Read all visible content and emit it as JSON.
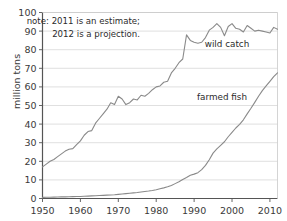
{
  "chart_data": {
    "type": "line",
    "title": "",
    "xlabel": "",
    "ylabel": "million tons",
    "xlim": [
      1950,
      2012
    ],
    "ylim": [
      0,
      100
    ],
    "grid": true,
    "legend_position": "inline-annotation",
    "xticks": [
      "1950",
      "1960",
      "1970",
      "1980",
      "1990",
      "2000",
      "2010"
    ],
    "xtick_values": [
      1950,
      1960,
      1970,
      1980,
      1990,
      2000,
      2010
    ],
    "yticks": [
      "0",
      "10",
      "20",
      "30",
      "40",
      "50",
      "60",
      "70",
      "80",
      "90",
      "100"
    ],
    "ytick_values": [
      0,
      10,
      20,
      30,
      40,
      50,
      60,
      70,
      80,
      90,
      100
    ],
    "annotations": [
      {
        "name": "note-line-1",
        "text": "note: 2011 is an estimate;"
      },
      {
        "name": "note-line-2",
        "text": "2012 is a projection."
      }
    ],
    "series": [
      {
        "name": "wild catch",
        "label": "wild catch",
        "color": "#8a8a8a",
        "x": [
          1950,
          1951,
          1952,
          1953,
          1954,
          1955,
          1956,
          1957,
          1958,
          1959,
          1960,
          1961,
          1962,
          1963,
          1964,
          1965,
          1966,
          1967,
          1968,
          1969,
          1970,
          1971,
          1972,
          1973,
          1974,
          1975,
          1976,
          1977,
          1978,
          1979,
          1980,
          1981,
          1982,
          1983,
          1984,
          1985,
          1986,
          1987,
          1988,
          1989,
          1990,
          1991,
          1992,
          1993,
          1994,
          1995,
          1996,
          1997,
          1998,
          1999,
          2000,
          2001,
          2002,
          2003,
          2004,
          2005,
          2006,
          2007,
          2008,
          2009,
          2010,
          2011,
          2012
        ],
        "values": [
          17.0,
          18.5,
          20.0,
          21.0,
          22.5,
          24.0,
          25.5,
          26.5,
          26.8,
          29.0,
          31.0,
          34.0,
          36.0,
          36.5,
          40.5,
          43.0,
          45.5,
          48.0,
          51.5,
          50.5,
          55.0,
          53.5,
          50.5,
          51.5,
          53.5,
          53.0,
          55.5,
          55.0,
          56.5,
          58.5,
          60.0,
          60.5,
          62.5,
          63.0,
          67.5,
          70.0,
          73.0,
          75.0,
          88.0,
          85.0,
          84.0,
          83.5,
          84.0,
          86.5,
          90.5,
          92.0,
          94.0,
          92.0,
          87.5,
          92.5,
          94.0,
          91.5,
          91.0,
          89.5,
          93.0,
          91.5,
          90.0,
          90.5,
          90.0,
          89.5,
          89.0,
          92.0,
          91.0
        ]
      },
      {
        "name": "farmed fish",
        "label": "farmed fish",
        "color": "#8a8a8a",
        "x": [
          1950,
          1951,
          1952,
          1953,
          1954,
          1955,
          1956,
          1957,
          1958,
          1959,
          1960,
          1961,
          1962,
          1963,
          1964,
          1965,
          1966,
          1967,
          1968,
          1969,
          1970,
          1971,
          1972,
          1973,
          1974,
          1975,
          1976,
          1977,
          1978,
          1979,
          1980,
          1981,
          1982,
          1983,
          1984,
          1985,
          1986,
          1987,
          1988,
          1989,
          1990,
          1991,
          1992,
          1993,
          1994,
          1995,
          1996,
          1997,
          1998,
          1999,
          2000,
          2001,
          2002,
          2003,
          2004,
          2005,
          2006,
          2007,
          2008,
          2009,
          2010,
          2011,
          2012
        ],
        "values": [
          0.6,
          0.65,
          0.7,
          0.75,
          0.8,
          0.85,
          0.9,
          0.95,
          1.0,
          1.05,
          1.1,
          1.2,
          1.3,
          1.4,
          1.5,
          1.6,
          1.7,
          1.8,
          1.9,
          2.0,
          2.2,
          2.4,
          2.6,
          2.8,
          3.0,
          3.2,
          3.5,
          3.8,
          4.0,
          4.3,
          4.7,
          5.2,
          5.7,
          6.3,
          7.0,
          8.0,
          9.0,
          10.2,
          11.3,
          12.5,
          13.1,
          13.9,
          15.5,
          17.8,
          20.8,
          24.4,
          26.7,
          28.6,
          30.5,
          33.2,
          35.5,
          37.9,
          39.8,
          42.3,
          45.5,
          48.5,
          51.7,
          55.0,
          58.0,
          60.5,
          63.0,
          65.5,
          67.5
        ]
      }
    ]
  },
  "axis": {
    "y_label": "million tons"
  }
}
